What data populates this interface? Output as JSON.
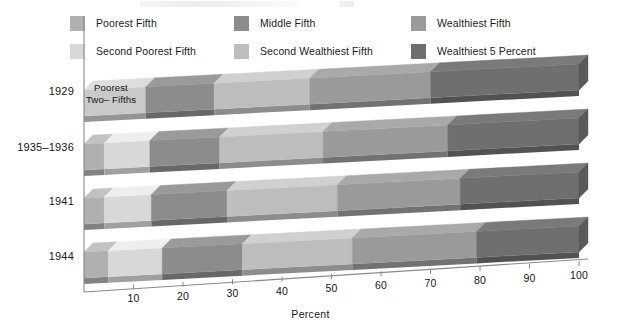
{
  "chart_data": {
    "type": "bar",
    "orientation": "horizontal",
    "stacked": true,
    "title": "",
    "xlabel": "Percent",
    "ylabel": "",
    "xlim": [
      0,
      100
    ],
    "xticks": [
      10,
      20,
      30,
      40,
      50,
      60,
      70,
      80,
      90,
      100
    ],
    "xtick_labels": [
      "10",
      "20",
      "30",
      "40",
      "50",
      "60",
      "70",
      "80",
      "90",
      "100"
    ],
    "grid": false,
    "legend_position": "top",
    "categories": [
      "1929",
      "1935-1936",
      "1941",
      "1944"
    ],
    "series": [
      {
        "name": "Poorest Fifth",
        "color": "#b0b0b0",
        "values": [
          null,
          4.1,
          4.1,
          4.9
        ]
      },
      {
        "name": "Second Poorest Fifth",
        "color": "#d8d8d8",
        "values": [
          null,
          9.2,
          9.5,
          10.9
        ]
      },
      {
        "name": "Middle Fifth",
        "color": "#8c8c8c",
        "values": [
          13.8,
          14.1,
          15.3,
          16.2
        ]
      },
      {
        "name": "Second Wealthiest Fifth",
        "color": "#bdbdbd",
        "values": [
          19.3,
          20.9,
          22.3,
          22.2
        ]
      },
      {
        "name": "Wealthiest Fifth",
        "color": "#9a9a9a",
        "values": [
          54.4,
          51.7,
          48.8,
          45.8
        ]
      }
    ],
    "overlay_series": {
      "name": "Wealthiest 5 Percent",
      "color": "#6f6f6f",
      "note": "subset of Wealthiest Fifth, drawn at right end of each bar",
      "values": [
        30.0,
        26.5,
        24.0,
        20.7
      ]
    },
    "merged_segments": [
      {
        "category": "1929",
        "label_line1": "Poorest",
        "label_line2": "Two– Fifths",
        "covers": [
          "Poorest Fifth",
          "Second Poorest Fifth"
        ],
        "value": 12.5,
        "color": "#c9c9c9"
      }
    ],
    "annotations": [
      {
        "text": "Poorest",
        "category": "1929"
      },
      {
        "text": "Two– Fifths",
        "category": "1929"
      }
    ]
  },
  "legend": {
    "rows": [
      [
        {
          "label": "Poorest Fifth",
          "color": "#b0b0b0"
        },
        {
          "label": "Middle Fifth",
          "color": "#8c8c8c"
        },
        {
          "label": "Wealthiest Fifth",
          "color": "#9a9a9a"
        }
      ],
      [
        {
          "label": "Second Poorest Fifth",
          "color": "#d8d8d8"
        },
        {
          "label": "Second Wealthiest Fifth",
          "color": "#bdbdbd"
        },
        {
          "label": "Wealthiest 5 Percent",
          "color": "#6f6f6f"
        }
      ]
    ]
  },
  "axis": {
    "x_title": "Percent",
    "ticks": [
      "10",
      "20",
      "30",
      "40",
      "50",
      "60",
      "70",
      "80",
      "90",
      "100"
    ],
    "year_labels": [
      "1929",
      "1935–1936",
      "1941",
      "1944"
    ]
  },
  "colors": {
    "poorest_fifth": "#b0b0b0",
    "second_poorest_fifth": "#d8d8d8",
    "middle_fifth": "#8c8c8c",
    "second_wealthiest_fifth": "#bdbdbd",
    "wealthiest_fifth": "#9a9a9a",
    "wealthiest_5_percent": "#6f6f6f",
    "poorest_two_fifths": "#c9c9c9",
    "axis": "#7a7a7a",
    "text": "#151515"
  }
}
